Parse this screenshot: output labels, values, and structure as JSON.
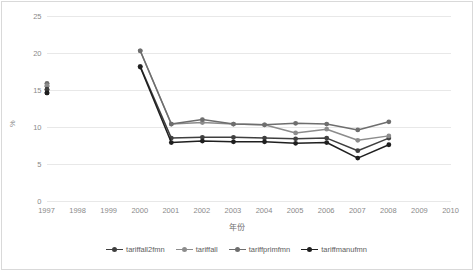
{
  "chart_data": {
    "type": "line",
    "title": "",
    "xlabel": "年份",
    "ylabel": "%",
    "x": [
      1997,
      1998,
      1999,
      2000,
      2001,
      2002,
      2003,
      2004,
      2005,
      2006,
      2007,
      2008,
      2009,
      2010
    ],
    "xtick_labels": [
      "1997",
      "1998",
      "1999",
      "2000",
      "2001",
      "2002",
      "2003",
      "2004",
      "2005",
      "2006",
      "2007",
      "2008",
      "2009",
      "2010"
    ],
    "ytick_labels": [
      "0",
      "5",
      "10",
      "15",
      "20",
      "25"
    ],
    "ytick_values": [
      0,
      5,
      10,
      15,
      20,
      25
    ],
    "ylim": [
      0,
      25
    ],
    "xlim": [
      1997,
      2010
    ],
    "grid": "horizontal",
    "legend_position": "bottom",
    "series": [
      {
        "name": "tariffall2fmn",
        "color": "#3f3f3f",
        "x": [
          1997,
          2000,
          2001,
          2002,
          2003,
          2004,
          2005,
          2006,
          2007,
          2008
        ],
        "values": [
          15.0,
          18.2,
          8.5,
          8.6,
          8.6,
          8.5,
          8.4,
          8.5,
          6.8,
          8.5
        ]
      },
      {
        "name": "tariffall",
        "color": "#8c8c8c",
        "x": [
          1997,
          2000,
          2001,
          2002,
          2003,
          2004,
          2005,
          2006,
          2007,
          2008
        ],
        "values": [
          15.8,
          20.3,
          10.4,
          10.6,
          10.4,
          10.3,
          9.2,
          9.7,
          8.2,
          8.8
        ]
      },
      {
        "name": "tariffprimfmn",
        "color": "#6e6e6e",
        "x": [
          1997,
          2000,
          2001,
          2002,
          2003,
          2004,
          2005,
          2006,
          2007,
          2008
        ],
        "values": [
          15.5,
          20.3,
          10.4,
          11.0,
          10.4,
          10.3,
          10.5,
          10.4,
          9.6,
          10.7
        ]
      },
      {
        "name": "tariffmanufmn",
        "color": "#1f1f1f",
        "x": [
          1997,
          2000,
          2001,
          2002,
          2003,
          2004,
          2005,
          2006,
          2007,
          2008
        ],
        "values": [
          14.6,
          18.1,
          7.9,
          8.1,
          8.0,
          8.0,
          7.8,
          7.9,
          5.8,
          7.6
        ]
      }
    ],
    "extra_markers_1997": [
      {
        "value": 15.9,
        "color": "#6e6e6e"
      },
      {
        "value": 15.6,
        "color": "#8c8c8c"
      },
      {
        "value": 15.1,
        "color": "#3f3f3f"
      },
      {
        "value": 14.6,
        "color": "#1f1f1f"
      }
    ]
  },
  "legend": {
    "items": [
      {
        "label": "tariffall2fmn",
        "color": "#3f3f3f"
      },
      {
        "label": "tariffall",
        "color": "#8c8c8c"
      },
      {
        "label": "tariffprimfmn",
        "color": "#6e6e6e"
      },
      {
        "label": "tariffmanufmn",
        "color": "#1f1f1f"
      }
    ]
  }
}
